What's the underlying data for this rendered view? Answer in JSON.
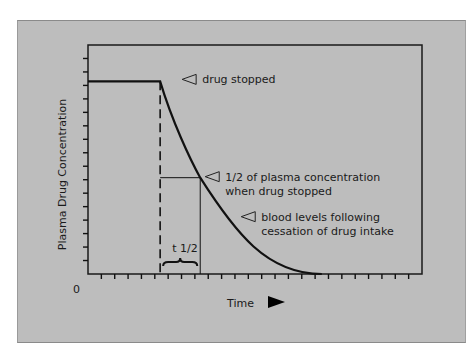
{
  "chart_data": {
    "type": "line",
    "title": "",
    "xlabel": "Time",
    "ylabel": "Plasma Drug Concentration",
    "origin_label": "0",
    "x_axis_arrow": true,
    "xlim": [
      0,
      25
    ],
    "ylim": [
      0,
      17
    ],
    "grid": false,
    "x_ticks_count": 25,
    "y_ticks_count": 17,
    "series": [
      {
        "name": "blood levels",
        "plateau_level": 14.3,
        "plateau_x": [
          0,
          5.4
        ],
        "drug_stopped_x": 5.4,
        "half_life_x": 8.4,
        "half_level": 7.15,
        "zero_reached_x": 17.5
      }
    ],
    "annotations": [
      {
        "id": "drug-stopped",
        "lines": [
          "drug stopped"
        ]
      },
      {
        "id": "half-concentration",
        "lines": [
          "1/2 of plasma concentration",
          "when drug stopped"
        ]
      },
      {
        "id": "blood-levels",
        "lines": [
          "blood levels following",
          "cessation of drug intake"
        ]
      },
      {
        "id": "half-life",
        "lines": [
          "t 1/2"
        ]
      }
    ],
    "colors": {
      "panel": "#bdbdbd",
      "line": "#111111"
    }
  }
}
